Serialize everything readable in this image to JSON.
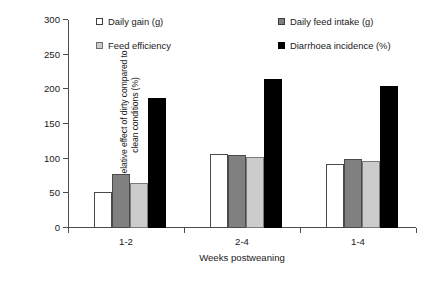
{
  "chart_data": {
    "type": "bar",
    "title": "",
    "xlabel": "Weeks postweaning",
    "ylabel": "Relative effect of dirty compared to\nclean conditions (%)",
    "categories": [
      "1-2",
      "2-4",
      "1-4"
    ],
    "ylim": [
      0,
      300
    ],
    "yticks": [
      0,
      50,
      100,
      150,
      200,
      250,
      300
    ],
    "ytick_labels": [
      "0",
      "50",
      "100",
      "150",
      "200",
      "250",
      "300"
    ],
    "grid": false,
    "legend_position": "top-inside",
    "series": [
      {
        "name": "Daily gain (g)",
        "color": "#ffffff",
        "values": [
          52,
          107,
          92
        ]
      },
      {
        "name": "Daily feed intake (g)",
        "color": "#808080",
        "values": [
          78,
          106,
          100
        ]
      },
      {
        "name": "Feed efficiency",
        "color": "#cccccc",
        "values": [
          65,
          103,
          97
        ]
      },
      {
        "name": "Diarrhoea incidence (%)",
        "color": "#000000",
        "values": [
          187,
          215,
          205
        ]
      }
    ]
  },
  "legend": {
    "items": [
      {
        "label": "Daily gain (g)",
        "swatch": "white"
      },
      {
        "label": "Feed efficiency",
        "swatch": "lgray"
      },
      {
        "label": "Daily feed intake (g)",
        "swatch": "dgray"
      },
      {
        "label": "Diarrhoea incidence (%)",
        "swatch": "black"
      }
    ]
  }
}
